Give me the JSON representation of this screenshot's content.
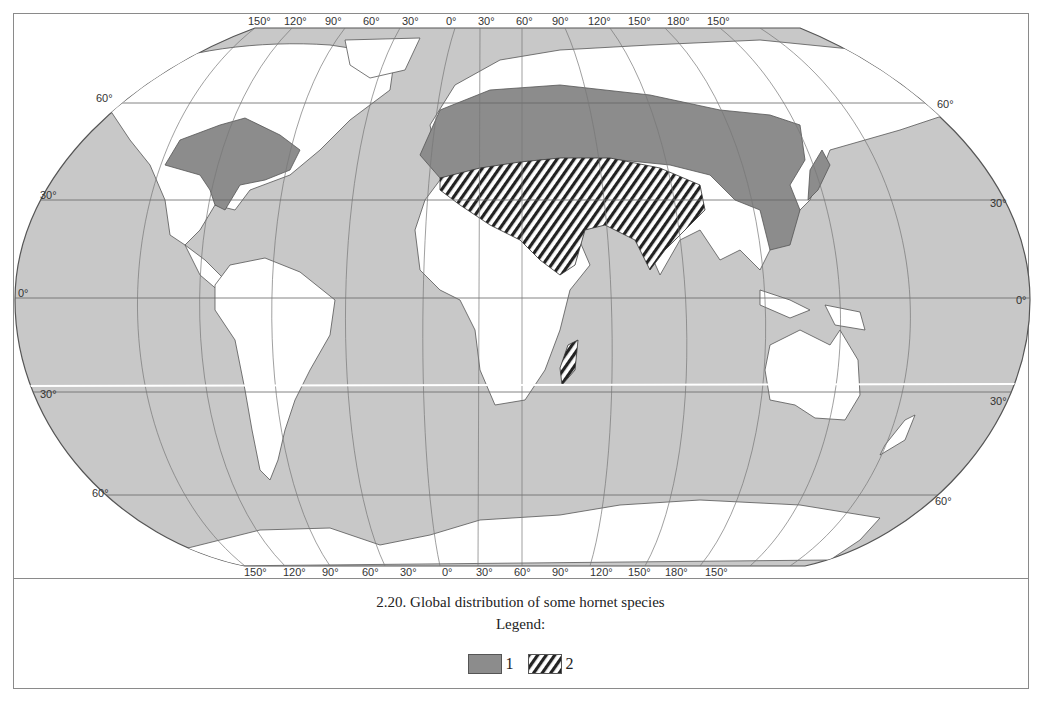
{
  "figure": {
    "caption": "2.20. Global distribution of some hornet species",
    "legend_title": "Legend:",
    "legend_items": [
      {
        "label": "1",
        "pattern": "solid-gray",
        "color": "#8c8c8c"
      },
      {
        "label": "2",
        "pattern": "diagonal-hatch",
        "color": "#222222"
      }
    ]
  },
  "map": {
    "projection": "Robinson-like pseudocylindrical",
    "ocean_color": "#c8c8c8",
    "land_color": "#ffffff",
    "range1_color": "#8c8c8c",
    "top_longitude_labels": [
      "150°",
      "120°",
      "90°",
      "60°",
      "30°",
      "0°",
      "30°",
      "60°",
      "90°",
      "120°",
      "150°",
      "180°",
      "150°"
    ],
    "bottom_longitude_labels": [
      "150°",
      "120°",
      "90°",
      "60°",
      "30°",
      "0°",
      "30°",
      "60°",
      "90°",
      "120°",
      "150°",
      "180°",
      "150°"
    ],
    "left_latitude_labels": [
      "60°",
      "30°",
      "0°",
      "30°",
      "60°"
    ],
    "right_latitude_labels": [
      "60°",
      "30°",
      "0°",
      "30°",
      "60°"
    ],
    "ranges": [
      {
        "id": 1,
        "regions": [
          "Eastern North America",
          "Europe",
          "Central Asia / Siberia southern belt",
          "China",
          "Korea",
          "Japan"
        ]
      },
      {
        "id": 2,
        "regions": [
          "North Africa / Sahara",
          "Arabian Peninsula",
          "Middle East",
          "Central Asia",
          "Northern India",
          "Madagascar"
        ]
      }
    ]
  }
}
